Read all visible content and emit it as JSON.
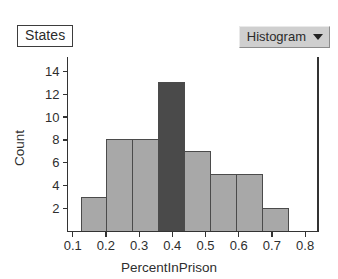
{
  "window": {
    "title": "Histogram"
  },
  "panel_label": {
    "text": "States"
  },
  "menu": {
    "label": "Histogram",
    "caret_icon": "chevron-down-icon"
  },
  "colors": {
    "bar_fill": "#a8a8a8",
    "bar_highlight_fill": "#4a4a4a",
    "bar_stroke": "#4b4b4b",
    "axis": "#333333",
    "text": "#2e2e2e",
    "menu_background": "#cfcfcf",
    "panel_border": "#3d3d3d"
  },
  "chart_data": {
    "type": "bar",
    "title": "",
    "subtitle": "",
    "xlabel": "PercentInPrison",
    "ylabel": "Count",
    "xlim": [
      0.075,
      0.825
    ],
    "ylim": [
      0,
      15
    ],
    "grid": false,
    "legend": null,
    "xticks": [
      "0.1",
      "0.2",
      "0.3",
      "0.4",
      "0.5",
      "0.6",
      "0.7",
      "0.8"
    ],
    "xtick_values": [
      0.1,
      0.2,
      0.3,
      0.4,
      0.5,
      0.6,
      0.7,
      0.8
    ],
    "yticks": [
      "2",
      "4",
      "6",
      "8",
      "10",
      "12",
      "14"
    ],
    "ytick_values": [
      2,
      4,
      6,
      8,
      10,
      12,
      14
    ],
    "bin_width": 0.078,
    "bins": [
      {
        "x0": 0.125,
        "x1": 0.203,
        "count": 3,
        "highlighted": false
      },
      {
        "x0": 0.203,
        "x1": 0.281,
        "count": 8,
        "highlighted": false
      },
      {
        "x0": 0.281,
        "x1": 0.359,
        "count": 8,
        "highlighted": false
      },
      {
        "x0": 0.359,
        "x1": 0.437,
        "count": 13,
        "highlighted": true
      },
      {
        "x0": 0.437,
        "x1": 0.516,
        "count": 7,
        "highlighted": false
      },
      {
        "x0": 0.516,
        "x1": 0.594,
        "count": 5,
        "highlighted": false
      },
      {
        "x0": 0.594,
        "x1": 0.672,
        "count": 5,
        "highlighted": false
      },
      {
        "x0": 0.672,
        "x1": 0.75,
        "count": 2,
        "highlighted": false
      }
    ],
    "categories": [
      "0.125-0.203",
      "0.203-0.281",
      "0.281-0.359",
      "0.359-0.437",
      "0.437-0.516",
      "0.516-0.594",
      "0.594-0.672",
      "0.672-0.750"
    ],
    "values": [
      3,
      8,
      8,
      13,
      7,
      5,
      5,
      2
    ]
  }
}
